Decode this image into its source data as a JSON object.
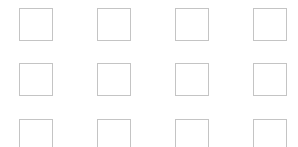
{
  "grid": {
    "columns": 4,
    "rows": 3,
    "border_color": "#c4c4c4",
    "background": "#ffffff",
    "column_x": [
      19,
      97,
      175,
      253
    ],
    "row_y": [
      8,
      63,
      119
    ],
    "tiles": [
      {
        "row": 0,
        "col": 0,
        "checked": false
      },
      {
        "row": 0,
        "col": 1,
        "checked": false
      },
      {
        "row": 0,
        "col": 2,
        "checked": false
      },
      {
        "row": 0,
        "col": 3,
        "checked": false
      },
      {
        "row": 1,
        "col": 0,
        "checked": false
      },
      {
        "row": 1,
        "col": 1,
        "checked": false
      },
      {
        "row": 1,
        "col": 2,
        "checked": false
      },
      {
        "row": 1,
        "col": 3,
        "checked": false
      },
      {
        "row": 2,
        "col": 0,
        "checked": false
      },
      {
        "row": 2,
        "col": 1,
        "checked": false
      },
      {
        "row": 2,
        "col": 2,
        "checked": false
      },
      {
        "row": 2,
        "col": 3,
        "checked": false
      }
    ]
  }
}
